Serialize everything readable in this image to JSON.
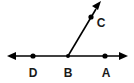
{
  "figure": {
    "background_color": "#ffffff",
    "stroke_color": "#000000",
    "label_color": "#1a1a1a",
    "width": 134,
    "height": 83,
    "points": [
      {
        "id": "D",
        "label": "D",
        "x": 33,
        "y": 56,
        "label_x": 33,
        "label_y": 77,
        "radius": 2.6
      },
      {
        "id": "B",
        "label": "B",
        "x": 68,
        "y": 56,
        "label_x": 68,
        "label_y": 77,
        "radius": 2.6
      },
      {
        "id": "A",
        "label": "A",
        "x": 105,
        "y": 56,
        "label_x": 106,
        "label_y": 77,
        "radius": 2.6
      },
      {
        "id": "C",
        "label": "C",
        "x": 91,
        "y": 17,
        "label_x": 101,
        "label_y": 27,
        "radius": 2.6
      }
    ],
    "lines": [
      {
        "id": "line-DA",
        "name": "horizontal-line",
        "x1": 9,
        "y1": 56,
        "x2": 126,
        "y2": 56,
        "arrow_start": true,
        "arrow_end": true
      },
      {
        "id": "ray-BC",
        "name": "ray-bc",
        "x1": 68,
        "y1": 56,
        "x2": 99,
        "y2": 4,
        "arrow_start": false,
        "arrow_end": true
      }
    ],
    "labels": {
      "point_a": "A",
      "point_b": "B",
      "point_c": "C",
      "point_d": "D"
    }
  }
}
